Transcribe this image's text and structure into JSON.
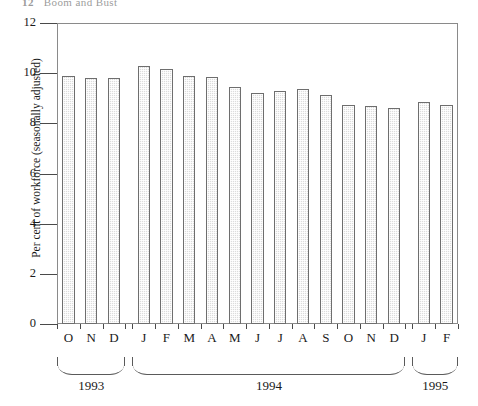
{
  "page_header": {
    "folio": "12",
    "running_head": "Boom and Bust"
  },
  "chart_data": {
    "type": "bar",
    "title": "",
    "xlabel": "",
    "ylabel": "Per cent of workforce (seasonally adjusted)",
    "ylim": [
      0,
      12
    ],
    "ytick_labels": [
      "0",
      "2",
      "4",
      "6",
      "8",
      "10",
      "12"
    ],
    "ytick_values": [
      0,
      2,
      4,
      6,
      8,
      10,
      12
    ],
    "grid": false,
    "legend": null,
    "categories": [
      "O",
      "N",
      "D",
      "J",
      "F",
      "M",
      "A",
      "M",
      "J",
      "J",
      "A",
      "S",
      "O",
      "N",
      "D",
      "J",
      "F"
    ],
    "values": [
      9.9,
      9.8,
      9.8,
      10.3,
      10.15,
      9.9,
      9.85,
      9.45,
      9.2,
      9.3,
      9.35,
      9.15,
      8.75,
      8.7,
      8.6,
      8.85,
      8.75
    ],
    "groups": [
      {
        "label": "1993",
        "start_index": 0,
        "count": 3
      },
      {
        "label": "1994",
        "start_index": 3,
        "count": 12
      },
      {
        "label": "1995",
        "start_index": 15,
        "count": 2
      }
    ],
    "colors": {
      "bar_fill": "#dcdcdc",
      "bar_border": "#6e6e6e",
      "axis": "#8a8a8a",
      "text": "#1a1a1a",
      "background": "#ffffff"
    }
  }
}
